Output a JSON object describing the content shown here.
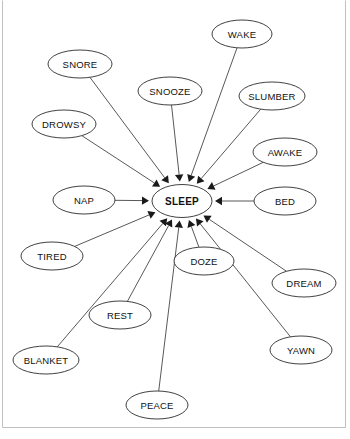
{
  "figure": {
    "type": "radial-concept-network",
    "title": "",
    "background_color": "#ffffff",
    "node_fill": "#ffffff",
    "node_stroke": "#2b2b2b",
    "edge_color": "#3a3a3a",
    "arrow_color": "#1a1a1a",
    "frame_color": "#b9b9b9",
    "edge_direction": "inward-to-center",
    "center_node": {
      "id": "sleep",
      "label": "SLEEP",
      "cx": 182,
      "cy": 201,
      "rx": 30,
      "ry": 16.5,
      "bold": true
    },
    "outer_nodes": [
      {
        "id": "wake",
        "label": "WAKE",
        "cx": 242,
        "cy": 34,
        "rx": 30,
        "ry": 14
      },
      {
        "id": "snore",
        "label": "SNORE",
        "cx": 80,
        "cy": 64,
        "rx": 32,
        "ry": 14
      },
      {
        "id": "snooze",
        "label": "SNOOZE",
        "cx": 170,
        "cy": 91,
        "rx": 32,
        "ry": 14
      },
      {
        "id": "slumber",
        "label": "SLUMBER",
        "cx": 272,
        "cy": 96,
        "rx": 33,
        "ry": 14
      },
      {
        "id": "drowsy",
        "label": "DROWSY",
        "cx": 64,
        "cy": 124,
        "rx": 32,
        "ry": 14
      },
      {
        "id": "awake",
        "label": "AWAKE",
        "cx": 285,
        "cy": 152,
        "rx": 32,
        "ry": 14
      },
      {
        "id": "nap",
        "label": "NAP",
        "cx": 84,
        "cy": 200,
        "rx": 31,
        "ry": 14
      },
      {
        "id": "bed",
        "label": "BED",
        "cx": 285,
        "cy": 201,
        "rx": 31,
        "ry": 14
      },
      {
        "id": "tired",
        "label": "TIRED",
        "cx": 52,
        "cy": 256,
        "rx": 31,
        "ry": 14
      },
      {
        "id": "doze",
        "label": "DOZE",
        "cx": 204,
        "cy": 261,
        "rx": 30,
        "ry": 14
      },
      {
        "id": "dream",
        "label": "DREAM",
        "cx": 304,
        "cy": 283,
        "rx": 32,
        "ry": 14
      },
      {
        "id": "rest",
        "label": "REST",
        "cx": 120,
        "cy": 315,
        "rx": 31,
        "ry": 14
      },
      {
        "id": "yawn",
        "label": "YAWN",
        "cx": 301,
        "cy": 350,
        "rx": 31,
        "ry": 14
      },
      {
        "id": "blanket",
        "label": "BLANKET",
        "cx": 46,
        "cy": 360,
        "rx": 33,
        "ry": 14
      },
      {
        "id": "peace",
        "label": "PEACE",
        "cx": 157,
        "cy": 405,
        "rx": 31,
        "ry": 14
      }
    ],
    "edges": [
      {
        "from": "wake",
        "to": "sleep"
      },
      {
        "from": "snore",
        "to": "sleep"
      },
      {
        "from": "snooze",
        "to": "sleep"
      },
      {
        "from": "slumber",
        "to": "sleep"
      },
      {
        "from": "drowsy",
        "to": "sleep"
      },
      {
        "from": "awake",
        "to": "sleep"
      },
      {
        "from": "nap",
        "to": "sleep"
      },
      {
        "from": "bed",
        "to": "sleep"
      },
      {
        "from": "tired",
        "to": "sleep"
      },
      {
        "from": "doze",
        "to": "sleep"
      },
      {
        "from": "dream",
        "to": "sleep"
      },
      {
        "from": "rest",
        "to": "sleep"
      },
      {
        "from": "yawn",
        "to": "sleep"
      },
      {
        "from": "blanket",
        "to": "sleep"
      },
      {
        "from": "peace",
        "to": "sleep"
      }
    ],
    "frame": {
      "left_x": 2.5,
      "right_x": 345.5,
      "bottom_y": 427.5,
      "top_y": 0.5
    }
  }
}
